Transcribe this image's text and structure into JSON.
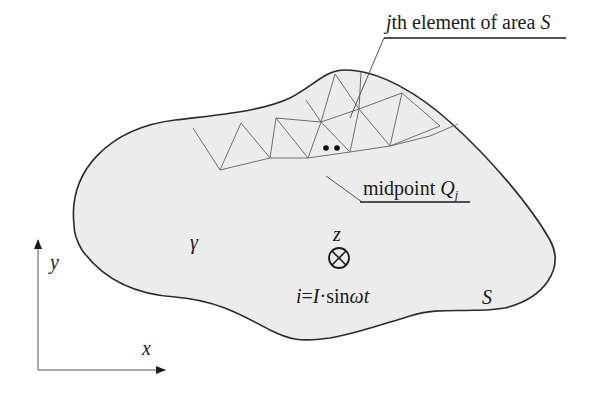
{
  "diagram": {
    "type": "field-region-with-mesh",
    "colors": {
      "region_fill": "#ececec",
      "outline": "#2a2a2a",
      "mesh": "#6e6e6e",
      "text": "#1a1a1a"
    },
    "labels": {
      "element_label_prefix": "j",
      "element_label_text": "th element of area ",
      "element_label_area": "S",
      "midpoint_label_text": "midpoint ",
      "midpoint_label_symbol": "Q",
      "midpoint_label_subscript": "j",
      "boundary_symbol": "γ",
      "area_symbol": "S",
      "current_direction_axis": "z",
      "current_formula_i": "i",
      "current_formula_eq": "=",
      "current_formula_I": "I",
      "current_formula_rest": "·sin",
      "current_formula_omega_t": "ωt"
    },
    "axes": {
      "x_label": "x",
      "y_label": "y"
    },
    "icons": {
      "current_into_page": "circle-with-cross",
      "midpoint_dots": "two-filled-dots"
    }
  }
}
